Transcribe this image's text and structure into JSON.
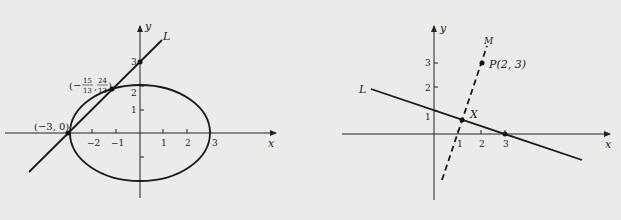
{
  "left_figure": {
    "axes": {
      "x_label": "x",
      "y_label": "y"
    },
    "x_ticks": [
      "−2",
      "−1",
      "1",
      "2",
      "3"
    ],
    "y_ticks": [
      "1",
      "2",
      "3"
    ],
    "line_label": "𝒮",
    "line_label_text": "L",
    "point_a": "(−3, 0)",
    "point_b": {
      "open": "(−",
      "n1": "15",
      "d1": "13",
      "comma": ",",
      "n2": "24",
      "d2": "13",
      "close": ")"
    },
    "ellipse": {
      "center": [
        0,
        0
      ],
      "a": 3,
      "b": 2.2
    }
  },
  "right_figure": {
    "axes": {
      "x_label": "x",
      "y_label": "y"
    },
    "x_ticks": [
      "1",
      "2",
      "3"
    ],
    "y_ticks": [
      "1",
      "2",
      "3"
    ],
    "line_l_label": "L",
    "line_m_label": "M",
    "point_p": "P(2, 3)",
    "point_x": "X"
  }
}
